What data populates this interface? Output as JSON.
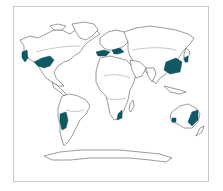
{
  "map": {
    "title": "World map with highlighted climate regions",
    "projection": "world outline",
    "colors": {
      "background": "#ffffff",
      "frame": "#c8c8c8",
      "coastline": "#555a5c",
      "highlight": "#0f5866"
    },
    "highlighted_regions": [
      {
        "name": "Pacific Northwest / California coast, North America"
      },
      {
        "name": "Southeastern United States"
      },
      {
        "name": "Mediterranean / Southern Europe"
      },
      {
        "name": "Black Sea / Caucasus region"
      },
      {
        "name": "Southeast China"
      },
      {
        "name": "Southern Japan / Korea"
      },
      {
        "name": "Southeastern South America (Uruguay, Southern Brazil, NE Argentina)"
      },
      {
        "name": "Southeastern Africa (Natal coast)"
      },
      {
        "name": "Eastern Australia"
      },
      {
        "name": "Southwestern Australia"
      }
    ]
  }
}
